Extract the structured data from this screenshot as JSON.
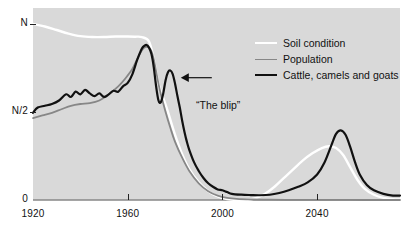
{
  "chart_data": {
    "type": "line",
    "title": "",
    "subtitle": "",
    "xlabel": "",
    "ylabel": "",
    "xlim": [
      1920,
      2075
    ],
    "ylim": [
      0,
      1.09
    ],
    "grid": false,
    "legend_position": "top-right",
    "y_ticks": [
      {
        "value": 1.0,
        "label": "N"
      },
      {
        "value": 0.5,
        "label": "N/2"
      },
      {
        "value": 0.0,
        "label": "0"
      }
    ],
    "x_ticks": [
      {
        "value": 1920,
        "label": "1920"
      },
      {
        "value": 1960,
        "label": "1960"
      },
      {
        "value": 2000,
        "label": "2000"
      },
      {
        "value": 2040,
        "label": "2040"
      }
    ],
    "annotations": [
      {
        "text": "“The blip”",
        "x": 1982,
        "y": 0.7,
        "arrow": "left"
      }
    ],
    "series": [
      {
        "name": "Soil condition",
        "color": "#ffffff",
        "width": 2.4,
        "x": [
          1920,
          1925,
          1930,
          1935,
          1940,
          1945,
          1950,
          1955,
          1960,
          1963,
          1966,
          1969,
          1971,
          1973,
          1975,
          1977,
          1980,
          1983,
          1986,
          1990,
          1994,
          1998,
          2002,
          2006,
          2010,
          2014,
          2018,
          2022,
          2026,
          2030,
          2034,
          2038,
          2042,
          2045,
          2048,
          2051,
          2054,
          2057,
          2060,
          2064,
          2068,
          2072,
          2075
        ],
        "y": [
          1.0,
          0.985,
          0.965,
          0.945,
          0.93,
          0.925,
          0.925,
          0.928,
          0.928,
          0.927,
          0.925,
          0.9,
          0.8,
          0.66,
          0.58,
          0.5,
          0.37,
          0.26,
          0.175,
          0.1,
          0.05,
          0.02,
          0.005,
          0.0,
          0.0,
          0.01,
          0.035,
          0.075,
          0.125,
          0.175,
          0.225,
          0.265,
          0.295,
          0.305,
          0.295,
          0.255,
          0.185,
          0.115,
          0.065,
          0.03,
          0.012,
          0.005,
          0.003
        ]
      },
      {
        "name": "Population",
        "color": "#878787",
        "width": 1.8,
        "x": [
          1920,
          1924,
          1928,
          1932,
          1936,
          1940,
          1944,
          1948,
          1952,
          1956,
          1959,
          1962,
          1964,
          1966,
          1967,
          1968,
          1969,
          1970,
          1971,
          1972,
          1973,
          1974,
          1976,
          1978,
          1980,
          1983,
          1986,
          1990,
          1994,
          1998,
          2002,
          2006,
          2012,
          2020,
          2030,
          2040,
          2050,
          2060,
          2075
        ],
        "y": [
          0.465,
          0.48,
          0.495,
          0.515,
          0.535,
          0.545,
          0.55,
          0.565,
          0.6,
          0.645,
          0.69,
          0.745,
          0.8,
          0.85,
          0.865,
          0.87,
          0.865,
          0.845,
          0.8,
          0.73,
          0.66,
          0.6,
          0.5,
          0.41,
          0.33,
          0.24,
          0.165,
          0.095,
          0.05,
          0.025,
          0.012,
          0.006,
          0.003,
          0.002,
          0.001,
          0.001,
          0.001,
          0.0,
          0.0
        ]
      },
      {
        "name": "Cattle, camels and goats",
        "color": "#111111",
        "width": 2.2,
        "x": [
          1920,
          1922,
          1925,
          1928,
          1931,
          1934,
          1936,
          1938,
          1940,
          1942,
          1944,
          1946,
          1948,
          1950,
          1952,
          1954,
          1956,
          1958,
          1960,
          1962,
          1964,
          1966,
          1967,
          1968,
          1969,
          1970,
          1971,
          1972,
          1973,
          1974,
          1975,
          1976,
          1977,
          1978,
          1979,
          1980,
          1981,
          1982,
          1983,
          1984,
          1985,
          1986,
          1988,
          1990,
          1992,
          1994,
          1996,
          1998,
          2000,
          2002,
          2004,
          2008,
          2012,
          2016,
          2020,
          2024,
          2028,
          2032,
          2036,
          2040,
          2043,
          2046,
          2048,
          2050,
          2052,
          2054,
          2056,
          2058,
          2061,
          2064,
          2068,
          2072,
          2075
        ],
        "y": [
          0.495,
          0.525,
          0.535,
          0.545,
          0.565,
          0.6,
          0.585,
          0.615,
          0.6,
          0.625,
          0.605,
          0.59,
          0.605,
          0.585,
          0.6,
          0.62,
          0.615,
          0.645,
          0.665,
          0.715,
          0.795,
          0.86,
          0.875,
          0.88,
          0.865,
          0.83,
          0.755,
          0.645,
          0.565,
          0.555,
          0.605,
          0.68,
          0.725,
          0.735,
          0.715,
          0.66,
          0.59,
          0.525,
          0.45,
          0.385,
          0.33,
          0.285,
          0.215,
          0.165,
          0.125,
          0.095,
          0.075,
          0.06,
          0.055,
          0.045,
          0.035,
          0.03,
          0.028,
          0.027,
          0.03,
          0.04,
          0.055,
          0.075,
          0.1,
          0.145,
          0.21,
          0.31,
          0.375,
          0.395,
          0.37,
          0.3,
          0.215,
          0.145,
          0.085,
          0.055,
          0.035,
          0.025,
          0.025
        ]
      }
    ]
  },
  "legend": {
    "entries": [
      {
        "label": "Soil condition",
        "color": "#ffffff"
      },
      {
        "label": "Population",
        "color": "#878787"
      },
      {
        "label": "Cattle, camels and goats",
        "color": "#111111"
      }
    ]
  }
}
